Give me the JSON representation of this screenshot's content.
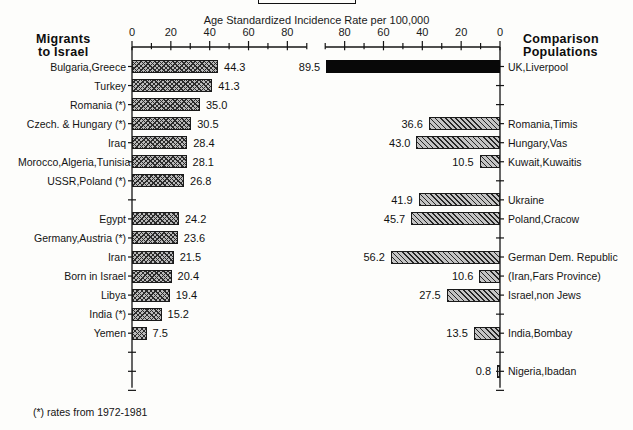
{
  "chart_data": {
    "type": "bar",
    "title": "Age Standardized Incidence Rate per 100,000",
    "xlabel": "Age Standardized Incidence Rate per 100,000",
    "ylabel": "",
    "orientation": "horizontal",
    "layout": "back-to-back paired panels",
    "grid": false,
    "legend": "none",
    "panels": [
      {
        "name": "left",
        "header": [
          "Migrants",
          "to Israel"
        ],
        "axis": {
          "ticks": [
            0,
            20,
            40,
            60,
            80
          ],
          "minor_tick_step": 10,
          "xlim": [
            0,
            90
          ],
          "direction": "left-to-right"
        },
        "categories": [
          "Bulgaria,Greece",
          "Turkey",
          "Romania (*)",
          "Czech. & Hungary (*)",
          "Iraq",
          "Morocco,Algeria,Tunisia",
          "USSR,Poland (*)",
          "Egypt",
          "Germany,Austria (*)",
          "Iran",
          "Born in Israel",
          "Libya",
          "India (*)",
          "Yemen"
        ],
        "values": [
          44.3,
          41.3,
          35.0,
          30.5,
          28.4,
          28.1,
          26.8,
          24.2,
          23.6,
          21.5,
          20.4,
          19.4,
          15.2,
          7.5
        ]
      },
      {
        "name": "right",
        "header": [
          "Comparison",
          "Populations"
        ],
        "axis": {
          "ticks": [
            80,
            60,
            40,
            20,
            0
          ],
          "minor_tick_step": 10,
          "xlim": [
            0,
            90
          ],
          "direction": "right-to-left"
        },
        "categories": [
          "UK,Liverpool",
          "Romania,Timis",
          "Hungary,Vas",
          "Kuwait,Kuwaitis",
          "Ukraine",
          "Poland,Cracow",
          "German Dem. Republic",
          "(Iran,Fars Province)",
          "Israel,non Jews",
          "India,Bombay",
          "Nigeria,Ibadan"
        ],
        "values": [
          89.5,
          36.6,
          43.0,
          10.5,
          41.9,
          45.7,
          56.2,
          10.6,
          27.5,
          13.5,
          0.8
        ]
      }
    ],
    "footnote": "(*) rates from 1972-1981"
  },
  "axis_title": "Age Standardized Incidence Rate per 100,000",
  "headers": {
    "left_line1": "Migrants",
    "left_line2": "to Israel",
    "right_line1": "Comparison",
    "right_line2": "Populations"
  },
  "left_ticks": [
    "0",
    "20",
    "40",
    "60",
    "80"
  ],
  "right_ticks": [
    "80",
    "60",
    "40",
    "20",
    "0"
  ],
  "left_rows": [
    {
      "label": "Bulgaria,Greece",
      "value": "44.3"
    },
    {
      "label": "Turkey",
      "value": "41.3"
    },
    {
      "label": "Romania (*)",
      "value": "35.0"
    },
    {
      "label": "Czech. & Hungary (*)",
      "value": "30.5"
    },
    {
      "label": "Iraq",
      "value": "28.4"
    },
    {
      "label": "Morocco,Algeria,Tunisia",
      "value": "28.1"
    },
    {
      "label": "USSR,Poland (*)",
      "value": "26.8"
    },
    {
      "label": "Egypt",
      "value": "24.2"
    },
    {
      "label": "Germany,Austria (*)",
      "value": "23.6"
    },
    {
      "label": "Iran",
      "value": "21.5"
    },
    {
      "label": "Born in Israel",
      "value": "20.4"
    },
    {
      "label": "Libya",
      "value": "19.4"
    },
    {
      "label": "India (*)",
      "value": "15.2"
    },
    {
      "label": "Yemen",
      "value": "7.5"
    }
  ],
  "right_rows": [
    {
      "label": "UK,Liverpool",
      "value": "89.5"
    },
    {
      "label": "Romania,Timis",
      "value": "36.6"
    },
    {
      "label": "Hungary,Vas",
      "value": "43.0"
    },
    {
      "label": "Kuwait,Kuwaitis",
      "value": "10.5"
    },
    {
      "label": "Ukraine",
      "value": "41.9"
    },
    {
      "label": "Poland,Cracow",
      "value": "45.7"
    },
    {
      "label": "German Dem. Republic",
      "value": "56.2"
    },
    {
      "label": "(Iran,Fars Province)",
      "value": "10.6"
    },
    {
      "label": "Israel,non Jews",
      "value": "27.5"
    },
    {
      "label": "India,Bombay",
      "value": "13.5"
    },
    {
      "label": "Nigeria,Ibadan",
      "value": "0.8"
    }
  ],
  "footnote": "(*) rates from 1972-1981"
}
